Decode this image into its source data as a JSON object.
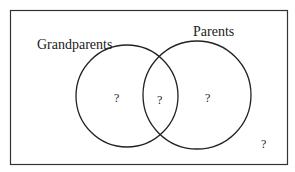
{
  "diagram": {
    "type": "venn",
    "top_text_fragments": [
      "",
      ""
    ],
    "sets": [
      {
        "label": "Grandparents",
        "cx": 127,
        "cy": 96,
        "r": 51,
        "label_x": 37,
        "label_y": 49
      },
      {
        "label": "Parents",
        "cx": 197,
        "cy": 95,
        "r": 54,
        "label_x": 193,
        "label_y": 36
      }
    ],
    "regions": {
      "grandparents_only": "?",
      "intersection": "?",
      "parents_only": "?",
      "outside": "?"
    },
    "stroke_color": "#222222",
    "background_color": "#ffffff"
  }
}
